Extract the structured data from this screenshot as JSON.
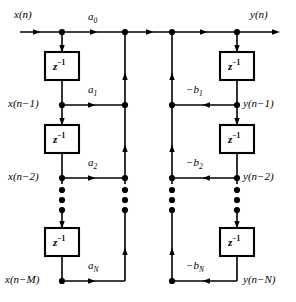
{
  "figure": {
    "type": "signal-flow-graph",
    "io": {
      "input_label": "x(n)",
      "output_label": "y(n)"
    },
    "feedforward": {
      "taps": [
        {
          "node_label": "x(n)",
          "coef": "a",
          "coef_sub": "0",
          "row": 0
        },
        {
          "node_label": "x(n−1)",
          "coef": "a",
          "coef_sub": "1",
          "row": 1
        },
        {
          "node_label": "x(n−2)",
          "coef": "a",
          "coef_sub": "2",
          "row": 2
        },
        {
          "node_label": "x(n−M)",
          "coef": "a",
          "coef_sub": "N",
          "row": 3
        }
      ]
    },
    "feedback": {
      "taps": [
        {
          "node_label": "y(n)",
          "coef": "",
          "coef_sub": "",
          "row": 0
        },
        {
          "node_label": "y(n−1)",
          "coef": "−b",
          "coef_sub": "1",
          "row": 1
        },
        {
          "node_label": "y(n−2)",
          "coef": "−b",
          "coef_sub": "2",
          "row": 2
        },
        {
          "node_label": "y(n−N)",
          "coef": "−b",
          "coef_sub": "N",
          "row": 3
        }
      ]
    },
    "delay_blocks": {
      "label": "z",
      "exponent": "−1",
      "count_left": 3,
      "count_right": 3
    },
    "ellipsis": {
      "glyph": "•",
      "dots_per_column": 3,
      "columns": 4
    },
    "colors": {
      "line": "#000000",
      "background": "#ffffff"
    }
  }
}
